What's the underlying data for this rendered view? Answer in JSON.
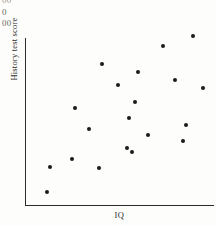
{
  "clipped_header": {
    "fragments": [
      "00",
      "0",
      "00"
    ]
  },
  "figure": {
    "y_axis_label": "History test score",
    "x_axis_label": "IQ"
  },
  "chart_data": {
    "type": "scatter",
    "title": "",
    "xlabel": "IQ",
    "ylabel": "History test score",
    "grid": false,
    "legend": false,
    "xlim": [
      0,
      100
    ],
    "ylim": [
      0,
      100
    ],
    "xticks": [],
    "yticks": [],
    "point_color": "#1a1a1a",
    "n_points": 20,
    "series": [
      {
        "name": "observations",
        "points": [
          {
            "x": 12.6,
            "y": 7.8
          },
          {
            "x": 14.1,
            "y": 22.8
          },
          {
            "x": 25.7,
            "y": 27.5
          },
          {
            "x": 27.2,
            "y": 58.1
          },
          {
            "x": 34.6,
            "y": 45.5
          },
          {
            "x": 39.8,
            "y": 13.8
          },
          {
            "x": 41.4,
            "y": 76.0
          },
          {
            "x": 49.7,
            "y": 63.5
          },
          {
            "x": 54.5,
            "y": 26.3
          },
          {
            "x": 57.1,
            "y": 24.0
          },
          {
            "x": 58.6,
            "y": 53.9
          },
          {
            "x": 60.2,
            "y": 71.9
          },
          {
            "x": 65.4,
            "y": 34.7
          },
          {
            "x": 73.3,
            "y": 87.4
          },
          {
            "x": 79.6,
            "y": 66.5
          },
          {
            "x": 83.8,
            "y": 29.9
          },
          {
            "x": 85.3,
            "y": 39.5
          },
          {
            "x": 89.0,
            "y": 93.4
          },
          {
            "x": 94.2,
            "y": 61.7
          },
          {
            "x": 55.5,
            "y": 43.7
          }
        ]
      }
    ],
    "pixel_points": [
      {
        "x": 47,
        "y": 192
      },
      {
        "x": 50,
        "y": 167
      },
      {
        "x": 72,
        "y": 159
      },
      {
        "x": 75,
        "y": 108
      },
      {
        "x": 89,
        "y": 129
      },
      {
        "x": 99,
        "y": 168
      },
      {
        "x": 102,
        "y": 64
      },
      {
        "x": 118,
        "y": 85
      },
      {
        "x": 127,
        "y": 148
      },
      {
        "x": 132,
        "y": 152
      },
      {
        "x": 135,
        "y": 102
      },
      {
        "x": 138,
        "y": 72
      },
      {
        "x": 148,
        "y": 135
      },
      {
        "x": 163,
        "y": 46
      },
      {
        "x": 175,
        "y": 80
      },
      {
        "x": 183,
        "y": 141
      },
      {
        "x": 186,
        "y": 125
      },
      {
        "x": 193,
        "y": 36
      },
      {
        "x": 203,
        "y": 88
      },
      {
        "x": 129,
        "y": 118
      }
    ]
  }
}
